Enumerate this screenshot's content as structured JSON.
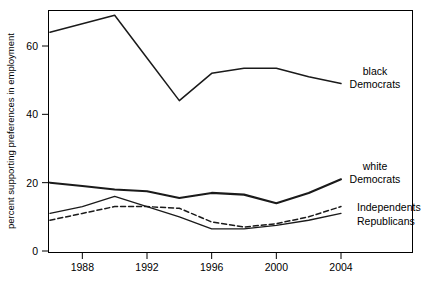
{
  "figure": {
    "background_color": "#ffffff",
    "line_color": "#1a1a1a",
    "frame_color": "#000000"
  },
  "chart_data": {
    "type": "line",
    "title": "",
    "xlabel": "",
    "ylabel": "percent supporting preferences in employment",
    "xlim": [
      1985,
      2005
    ],
    "ylim": [
      0,
      72
    ],
    "xticks": [
      1988,
      1992,
      1996,
      2000,
      2004
    ],
    "xtick_labels": [
      "1988",
      "1992",
      "1996",
      "2000",
      "2004"
    ],
    "yticks": [
      0,
      20,
      40,
      60
    ],
    "ytick_labels": [
      "0",
      "20",
      "40",
      "60"
    ],
    "grid": false,
    "legend_position": "right-inline-labels",
    "x": [
      1986,
      1988,
      1990,
      1992,
      1994,
      1996,
      1998,
      2000,
      2002,
      2004
    ],
    "series": [
      {
        "name": "black Democrats",
        "label": "black\nDemocrats",
        "label_line1": "black",
        "label_line2": "Democrats",
        "style": "solid",
        "values": [
          64,
          66.5,
          69,
          56.5,
          44,
          52,
          53.5,
          53.5,
          51,
          49
        ]
      },
      {
        "name": "white Democrats",
        "label": "white\nDemocrats",
        "label_line1": "white",
        "label_line2": "Democrats",
        "style": "solid-thick",
        "values": [
          20,
          19,
          18,
          17.5,
          15.5,
          17,
          16.5,
          14,
          17,
          21
        ]
      },
      {
        "name": "Independents",
        "label": "Independents",
        "label_line1": "Independents",
        "label_line2": "",
        "style": "dashed",
        "values": [
          9,
          11,
          13,
          13,
          12.5,
          8.5,
          7,
          8,
          10,
          13
        ]
      },
      {
        "name": "Republicans",
        "label": "Republicans",
        "label_line1": "Republicans",
        "label_line2": "",
        "style": "solid-thin",
        "values": [
          11,
          13,
          16,
          13,
          10,
          6.5,
          6.5,
          7.5,
          9,
          11
        ]
      }
    ]
  },
  "caption": {
    "partial_text": ""
  }
}
